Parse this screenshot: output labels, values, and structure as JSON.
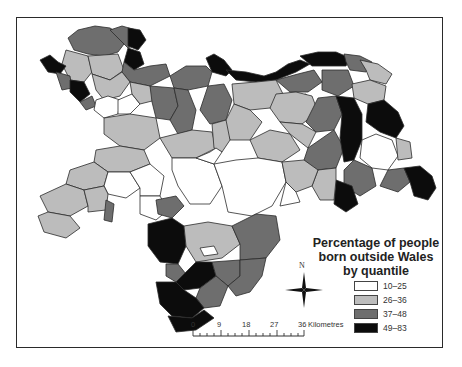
{
  "legend": {
    "title_line1": "Percentage of people",
    "title_line2": "born outside Wales",
    "title_line3": "by quantile",
    "items": [
      {
        "label": "10–25",
        "color": "#ffffff"
      },
      {
        "label": "26–36",
        "color": "#bcbcbc"
      },
      {
        "label": "37–48",
        "color": "#6e6e6e"
      },
      {
        "label": "49–83",
        "color": "#0c0c0c"
      }
    ]
  },
  "compass": {
    "north_label": "N"
  },
  "scale_bar": {
    "ticks": [
      "0",
      "9",
      "18",
      "27",
      "36"
    ],
    "unit": "Kilometres"
  },
  "map": {
    "subject": "Wales administrative areas",
    "classes": [
      "10–25",
      "26–36",
      "37–48",
      "49–83"
    ]
  }
}
